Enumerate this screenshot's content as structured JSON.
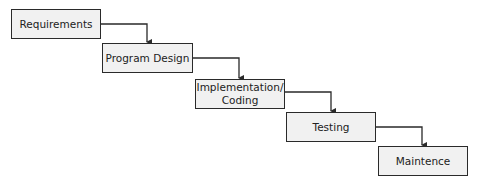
{
  "diagram": {
    "steps": [
      {
        "label": "Requirements"
      },
      {
        "label": "Program Design"
      },
      {
        "label": "Implementation/\nCoding"
      },
      {
        "label": "Testing"
      },
      {
        "label": "Maintence"
      }
    ],
    "colors": {
      "box_fill": "#f1f1f1",
      "border": "#2a2a2a",
      "arrow": "#2a2a2a"
    }
  }
}
